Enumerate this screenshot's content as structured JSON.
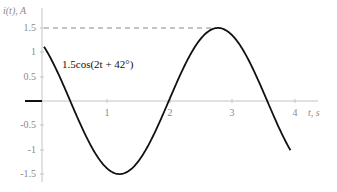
{
  "chart_data": {
    "type": "line",
    "title": "",
    "xlabel": "t, s",
    "ylabel": "i(t), A",
    "xlim": [
      0,
      4.1
    ],
    "ylim": [
      -1.5,
      1.6
    ],
    "x_ticks": [
      1,
      2,
      3,
      4
    ],
    "x_tick_labels": [
      "1",
      "2",
      "3",
      "4"
    ],
    "y_ticks": [
      -1.5,
      -1,
      -0.5,
      0.5,
      1,
      1.5
    ],
    "y_tick_labels": [
      "-1.5",
      "-1",
      "-0.5",
      "0.5",
      "1",
      "1.5"
    ],
    "grid": false,
    "series": [
      {
        "name": "1.5cos(2t + 42°)",
        "amplitude": 1.5,
        "omega": 2,
        "phase_deg": 42,
        "t_start": 0,
        "t_end": 3.93,
        "x": [
          0,
          0.25,
          0.5,
          0.75,
          1.0,
          1.25,
          1.5,
          1.75,
          2.0,
          2.25,
          2.5,
          2.75,
          3.0,
          3.25,
          3.5,
          3.75,
          3.93
        ],
        "values": [
          1.11,
          0.48,
          -0.22,
          -0.86,
          -1.35,
          -1.5,
          -1.31,
          -0.78,
          -0.1,
          0.59,
          1.16,
          1.49,
          1.42,
          0.98,
          0.31,
          -0.41,
          -0.89
        ]
      }
    ],
    "annotations": [
      {
        "text": "1.5cos(2t + 42°)",
        "type": "label"
      },
      {
        "text": "dashed line at i = 1.5 marking peak",
        "type": "reference-line",
        "y": 1.5
      }
    ],
    "pre_zero_segment": {
      "value": 0,
      "t_from": -0.3,
      "t_to": 0
    }
  },
  "labels": {
    "y_axis_title": "i(t), A",
    "x_axis_title": "t, s",
    "curve_label": "1.5cos(2t + 42°)"
  },
  "colors": {
    "curve": "#111111",
    "axis": "#b5b5b5",
    "text": "#8a8a8a",
    "dashed": "#8a8a8a"
  }
}
